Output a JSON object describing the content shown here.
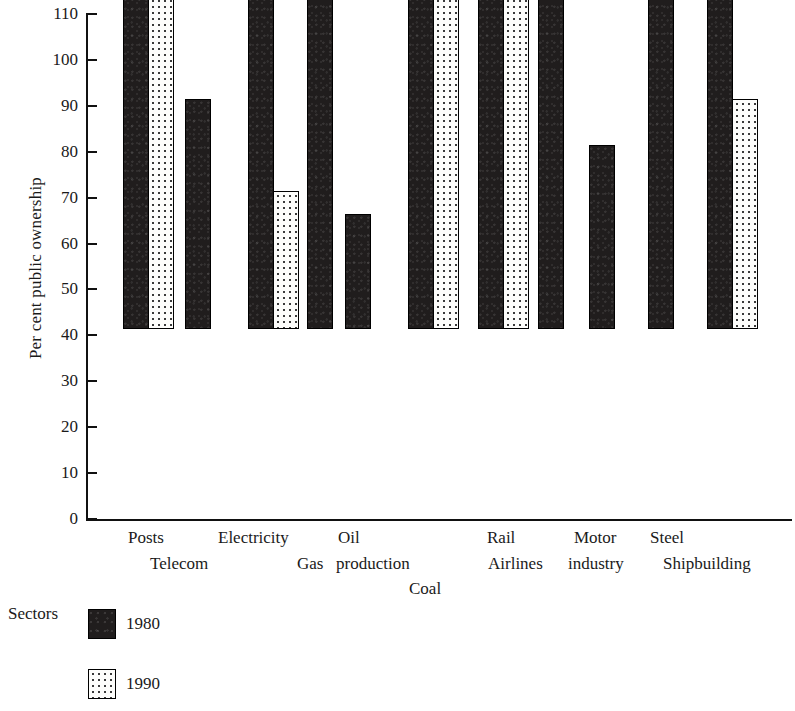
{
  "chart_data": {
    "type": "bar",
    "title": "",
    "xlabel": "Sectors",
    "ylabel": "Per cent public ownership",
    "ylim": [
      0,
      110
    ],
    "ytick_step": 10,
    "yticks": [
      0,
      10,
      20,
      30,
      40,
      50,
      60,
      70,
      80,
      90,
      100,
      110
    ],
    "grid": false,
    "legend_position": "bottom-left",
    "categories": [
      "Posts",
      "Telecom",
      "Electricity",
      "Gas",
      "Oil production",
      "Coal",
      "Rail",
      "Airlines",
      "Motor industry",
      "Steel",
      "Shipbuilding"
    ],
    "series": [
      {
        "name": "1980",
        "color": "#201d1d",
        "values": [
          100,
          50,
          100,
          75,
          25,
          100,
          100,
          75,
          40,
          75,
          100
        ]
      },
      {
        "name": "1990",
        "color": "#fdfdfb",
        "values": [
          100,
          0,
          30,
          0,
          0,
          100,
          100,
          0,
          0,
          0,
          50
        ]
      }
    ]
  },
  "axis": {
    "y_title": "Per cent public ownership",
    "y_tick_labels": [
      "110",
      "100",
      "90",
      "80",
      "70",
      "60",
      "50",
      "40",
      "30",
      "20",
      "10",
      "0"
    ],
    "x_title": "Sectors"
  },
  "x_labels": [
    {
      "text": "Posts",
      "x": 128,
      "y": 529
    },
    {
      "text": "Telecom",
      "x": 150,
      "y": 555
    },
    {
      "text": "Electricity",
      "x": 218,
      "y": 529
    },
    {
      "text": "Gas",
      "x": 297,
      "y": 555
    },
    {
      "text": "Oil",
      "x": 338,
      "y": 529
    },
    {
      "text": "production",
      "x": 336,
      "y": 555
    },
    {
      "text": "Coal",
      "x": 409,
      "y": 580
    },
    {
      "text": "Rail",
      "x": 487,
      "y": 529
    },
    {
      "text": "Airlines",
      "x": 488,
      "y": 555
    },
    {
      "text": "Motor",
      "x": 574,
      "y": 529
    },
    {
      "text": "industry",
      "x": 568,
      "y": 555
    },
    {
      "text": "Steel",
      "x": 650,
      "y": 529
    },
    {
      "text": "Shipbuilding",
      "x": 663,
      "y": 555
    }
  ],
  "bars": [
    {
      "category": "Posts",
      "series": "1980",
      "value": 100,
      "x": 123
    },
    {
      "category": "Posts",
      "series": "1990",
      "value": 100,
      "x": 148
    },
    {
      "category": "Telecom",
      "series": "1980",
      "value": 50,
      "x": 185
    },
    {
      "category": "Electricity",
      "series": "1980",
      "value": 100,
      "x": 248
    },
    {
      "category": "Electricity",
      "series": "1990",
      "value": 30,
      "x": 273
    },
    {
      "category": "Gas",
      "series": "1980",
      "value": 75,
      "x": 307
    },
    {
      "category": "Oil production",
      "series": "1980",
      "value": 25,
      "x": 345
    },
    {
      "category": "Coal",
      "series": "1980",
      "value": 100,
      "x": 408
    },
    {
      "category": "Coal",
      "series": "1990",
      "value": 100,
      "x": 433
    },
    {
      "category": "Rail",
      "series": "1980",
      "value": 100,
      "x": 478
    },
    {
      "category": "Rail",
      "series": "1990",
      "value": 100,
      "x": 503
    },
    {
      "category": "Airlines",
      "series": "1980",
      "value": 75,
      "x": 538
    },
    {
      "category": "Motor industry",
      "series": "1980",
      "value": 40,
      "x": 589
    },
    {
      "category": "Steel",
      "series": "1980",
      "value": 75,
      "x": 648
    },
    {
      "category": "Shipbuilding",
      "series": "1980",
      "value": 100,
      "x": 707
    },
    {
      "category": "Shipbuilding",
      "series": "1990",
      "value": 50,
      "x": 732
    }
  ],
  "legend": {
    "axis_name": "Sectors",
    "entries": [
      {
        "label": "1980",
        "swatch": "solid-black",
        "x": 88,
        "y": 609,
        "label_x": 126,
        "label_y": 615
      },
      {
        "label": "1990",
        "swatch": "dotted-white",
        "x": 88,
        "y": 669,
        "label_x": 126,
        "label_y": 675
      }
    ]
  }
}
